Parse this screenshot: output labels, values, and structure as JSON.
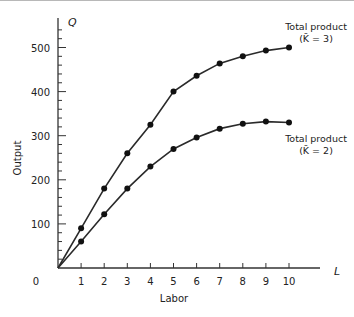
{
  "chart_data": {
    "type": "line",
    "title": "",
    "xlabel": "Labor",
    "ylabel": "Output",
    "x_axis_symbol": "L",
    "y_axis_symbol": "Q",
    "x": [
      0,
      1,
      2,
      3,
      4,
      5,
      6,
      7,
      8,
      9,
      10
    ],
    "xticks": [
      "0",
      "1",
      "2",
      "3",
      "4",
      "5",
      "6",
      "7",
      "8",
      "9",
      "10"
    ],
    "yticks": [
      "100",
      "200",
      "300",
      "400",
      "500"
    ],
    "xlim": [
      0,
      11.5
    ],
    "ylim": [
      0,
      560
    ],
    "grid": false,
    "legend": "inline labels at right end of each curve",
    "series": [
      {
        "name": "Total product (K̄ = 3)",
        "label_line1": "Total product",
        "label_line2": "(K̄ = 3)",
        "values": [
          0,
          90,
          180,
          260,
          325,
          400,
          436,
          464,
          480,
          493,
          500
        ]
      },
      {
        "name": "Total product (K̄ = 2)",
        "label_line1": "Total product",
        "label_line2": "(K̄ = 2)",
        "values": [
          0,
          60,
          122,
          180,
          230,
          270,
          296,
          316,
          327,
          332,
          330
        ]
      }
    ]
  }
}
